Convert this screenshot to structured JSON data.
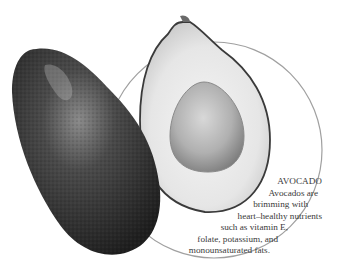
{
  "illustration": {
    "subject": "avocado",
    "elements": [
      "whole-avocado",
      "halved-avocado",
      "avocado-pit",
      "background-circle"
    ]
  },
  "caption": {
    "title": "AVOCADO",
    "lines": [
      "Avocados are",
      "brimming with",
      "heart–healthy nutrients",
      "such as vitamin E,",
      "folate, potassium, and",
      "monounsaturated fats."
    ]
  },
  "colors": {
    "circle_stroke": "#9a9a9a",
    "skin": "#3a3a3a",
    "flesh": "#e8e8e8",
    "pit": "#b8b8b8",
    "text": "#3a3a3a"
  }
}
